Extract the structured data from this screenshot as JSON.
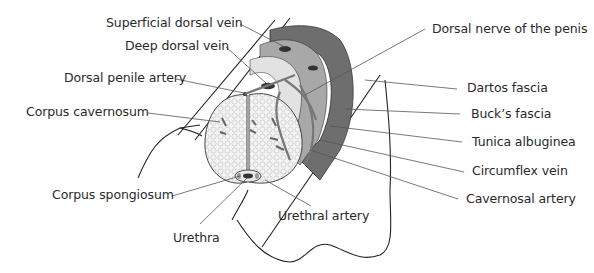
{
  "diagram": {
    "labels": {
      "superficial_dorsal_vein": "Superficial dorsal vein",
      "deep_dorsal_vein": "Deep dorsal vein",
      "dorsal_penile_artery": "Dorsal penile artery",
      "corpus_cavernosum": "Corpus cavernosum",
      "corpus_spongiosum": "Corpus spongiosum",
      "urethra": "Urethra",
      "urethral_artery": "Urethral  artery",
      "dorsal_nerve": "Dorsal nerve of the penis",
      "dartos_fascia": "Dartos fascia",
      "bucks_fascia": "Buck’s fascia",
      "tunica_albuginea": "Tunica albuginea",
      "circumflex_vein": "Circumflex vein",
      "cavernosal_artery": "Cavernosal artery"
    },
    "colors": {
      "dartos": "#6e6e6e",
      "bucks": "#a8a8a8",
      "tunica": "#e2e2e2",
      "vessel": "#bdbdbd",
      "line": "#222222",
      "text": "#2a2a2a"
    }
  }
}
